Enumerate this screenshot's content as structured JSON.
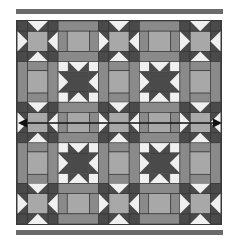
{
  "figure": {
    "type": "quilt-layout-diagram",
    "grid": {
      "rows": 5,
      "cols": 5
    },
    "blocks": {
      "light_star": "sawtooth star with medium-gray center and white triangle points",
      "dark_star": "dark sawtooth star on light background",
      "sashing": "medium gray bars with dark cornerstones"
    },
    "pattern": [
      [
        "light_star",
        "sashing",
        "light_star",
        "sashing",
        "light_star"
      ],
      [
        "sashing",
        "dark_star",
        "sashing",
        "dark_star",
        "sashing"
      ],
      [
        "light_star",
        "sashing",
        "light_star",
        "sashing",
        "light_star"
      ],
      [
        "sashing",
        "dark_star",
        "sashing",
        "dark_star",
        "sashing"
      ],
      [
        "light_star",
        "sashing",
        "light_star",
        "sashing",
        "light_star"
      ]
    ],
    "colors": {
      "dark": "#4a4a4a",
      "medium": "#8a8a8a",
      "light_gray": "#a8a8a8",
      "white": "#f0f0f0",
      "border": "#6a6a6a",
      "arrow": "#111111"
    },
    "annotations": {
      "arrow": "double-headed horizontal arrow indicating quilt width",
      "top_strip": "border strip",
      "bottom_strip": "border strip"
    }
  }
}
